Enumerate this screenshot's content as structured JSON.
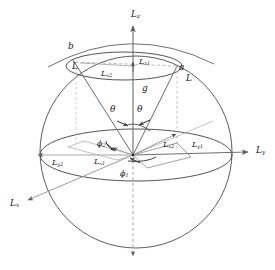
{
  "figure": {
    "type": "3d-vector-diagram",
    "header_fragment": "——  · · · ·",
    "colors": {
      "outline": "#4a4a4a",
      "vector": "#6b6b6b",
      "axis": "#6e6e6e",
      "dashed": "#9a9a9a",
      "text": "#1a1a1a"
    }
  },
  "axes": [
    {
      "id": "lz",
      "label": "L",
      "sub": "z",
      "x": 131,
      "y": 10
    },
    {
      "id": "ly",
      "label": "L",
      "sub": "y",
      "x": 256,
      "y": 146
    },
    {
      "id": "lx",
      "label": "L",
      "sub": "x",
      "x": 10,
      "y": 199
    }
  ],
  "points": [
    {
      "id": "b",
      "label": "b",
      "x": 68,
      "y": 42
    },
    {
      "id": "a",
      "label": "a",
      "x": 179,
      "y": 63
    }
  ],
  "vectors": [
    {
      "id": "l-left",
      "label": "L",
      "sub": "",
      "x": 72,
      "y": 62
    },
    {
      "id": "l-right",
      "label": "L",
      "sub": "",
      "x": 186,
      "y": 74
    }
  ],
  "components": [
    {
      "id": "lx2-cap",
      "label": "L",
      "sub": "x2",
      "x": 101,
      "y": 70
    },
    {
      "id": "lz1",
      "label": "L",
      "sub": "z1",
      "x": 139,
      "y": 58
    },
    {
      "id": "g",
      "label": "g",
      "sub": "",
      "x": 142,
      "y": 84
    },
    {
      "id": "lx2-eq",
      "label": "L",
      "sub": "x2",
      "x": 163,
      "y": 141
    },
    {
      "id": "ly1",
      "label": "L",
      "sub": "y1",
      "x": 192,
      "y": 141
    },
    {
      "id": "ly2",
      "label": "L",
      "sub": "y2",
      "x": 52,
      "y": 159
    },
    {
      "id": "lx1",
      "label": "L",
      "sub": "x1",
      "x": 94,
      "y": 158
    }
  ],
  "angles": [
    {
      "id": "theta-left",
      "label": "θ",
      "sub": "",
      "x": 110,
      "y": 105
    },
    {
      "id": "theta-right",
      "label": "θ",
      "sub": "",
      "x": 137,
      "y": 105
    },
    {
      "id": "phi2",
      "label": "ϕ",
      "sub": "2",
      "x": 97,
      "y": 140
    },
    {
      "id": "phi1",
      "label": "ϕ",
      "sub": "1",
      "x": 120,
      "y": 170
    }
  ]
}
